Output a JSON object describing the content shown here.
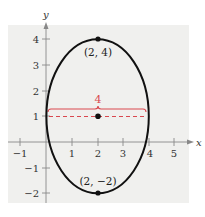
{
  "diagram": {
    "type": "ellipse-graph",
    "background_color": "#f0f0ee",
    "ellipse_color": "#111111",
    "accent_color": "#d9484f",
    "axes": {
      "x_label": "x",
      "y_label": "y",
      "x_ticks": [
        "-1",
        "1",
        "2",
        "3",
        "4",
        "5"
      ],
      "y_ticks": [
        "4",
        "3",
        "2",
        "1",
        "-1",
        "-2"
      ]
    },
    "ellipse": {
      "center": [
        2,
        1
      ],
      "semi_axis_x": 2,
      "semi_axis_y": 3
    },
    "points": [
      {
        "label": "(2, 4)",
        "x": 2,
        "y": 4
      },
      {
        "label": "(2, 1)",
        "x": 2,
        "y": 1,
        "shown_label": false
      },
      {
        "label": "(2, −2)",
        "x": 2,
        "y": -2
      }
    ],
    "width_annotation": {
      "label": "4",
      "from_x": 0,
      "to_x": 4,
      "y": 1
    }
  },
  "labels": {
    "top_vertex": "(2, 4)",
    "bottom_vertex": "(2, −2)",
    "width": "4",
    "x_axis": "x",
    "y_axis": "y",
    "xt_m1": "−1",
    "xt_1": "1",
    "xt_2": "2",
    "xt_3": "3",
    "xt_4": "4",
    "xt_5": "5",
    "yt_4": "4",
    "yt_3": "3",
    "yt_2": "2",
    "yt_1": "1",
    "yt_m1": "−1",
    "yt_m2": "−2"
  }
}
